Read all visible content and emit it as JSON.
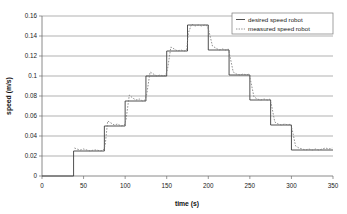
{
  "chart_data": {
    "type": "line",
    "title": "",
    "xlabel": "time (s)",
    "ylabel": "speed (m/s)",
    "xlim": [
      0,
      350
    ],
    "ylim": [
      0,
      0.16
    ],
    "grid": true,
    "legend_position": "top-right",
    "xticks": [
      "0",
      "50",
      "100",
      "150",
      "200",
      "250",
      "300",
      "350"
    ],
    "xtick_values": [
      0,
      50,
      100,
      150,
      200,
      250,
      300,
      350
    ],
    "yticks": [
      "0",
      "0.02",
      "0.04",
      "0.06",
      "0.08",
      "0.1",
      "0.12",
      "0.14",
      "0.16"
    ],
    "ytick_values": [
      0,
      0.02,
      0.04,
      0.06,
      0.08,
      0.1,
      0.12,
      0.14,
      0.16
    ],
    "series": [
      {
        "name": "desired speed robot",
        "style": "solid",
        "color": "#3c3c3c",
        "x": [
          0,
          38,
          38,
          75,
          75,
          100,
          100,
          125,
          125,
          150,
          150,
          175,
          175,
          200,
          200,
          225,
          225,
          250,
          250,
          275,
          275,
          300,
          300,
          350
        ],
        "y": [
          0,
          0,
          0.025,
          0.025,
          0.05,
          0.05,
          0.075,
          0.075,
          0.1,
          0.1,
          0.125,
          0.125,
          0.151,
          0.151,
          0.126,
          0.126,
          0.101,
          0.101,
          0.076,
          0.076,
          0.051,
          0.051,
          0.026,
          0.026
        ]
      },
      {
        "name": "measured speed robot",
        "style": "dotted",
        "color": "#777777",
        "x": [
          39,
          42,
          46,
          50,
          54,
          58,
          62,
          66,
          70,
          74,
          76,
          79,
          83,
          87,
          91,
          95,
          99,
          101,
          105,
          109,
          113,
          117,
          121,
          124,
          126,
          130,
          134,
          138,
          142,
          146,
          149,
          151,
          155,
          159,
          163,
          167,
          171,
          174,
          176,
          180,
          184,
          188,
          192,
          196,
          199,
          201,
          205,
          209,
          213,
          217,
          221,
          224,
          226,
          230,
          234,
          238,
          242,
          246,
          249,
          251,
          255,
          259,
          263,
          267,
          271,
          274,
          276,
          280,
          284,
          288,
          292,
          296,
          299,
          301,
          305,
          309,
          313,
          317,
          321,
          325,
          329,
          333,
          337,
          341,
          345,
          349
        ],
        "y": [
          0.028,
          0.027,
          0.026,
          0.027,
          0.026,
          0.025,
          0.026,
          0.026,
          0.025,
          0.026,
          0.031,
          0.055,
          0.053,
          0.051,
          0.052,
          0.05,
          0.051,
          0.056,
          0.081,
          0.078,
          0.076,
          0.077,
          0.075,
          0.076,
          0.082,
          0.104,
          0.102,
          0.1,
          0.101,
          0.1,
          0.101,
          0.107,
          0.129,
          0.127,
          0.125,
          0.126,
          0.125,
          0.126,
          0.143,
          0.152,
          0.15,
          0.151,
          0.15,
          0.151,
          0.15,
          0.144,
          0.13,
          0.128,
          0.126,
          0.127,
          0.126,
          0.127,
          0.12,
          0.104,
          0.102,
          0.101,
          0.102,
          0.101,
          0.102,
          0.095,
          0.079,
          0.077,
          0.076,
          0.077,
          0.076,
          0.077,
          0.071,
          0.054,
          0.052,
          0.051,
          0.052,
          0.051,
          0.052,
          0.046,
          0.03,
          0.028,
          0.027,
          0.026,
          0.027,
          0.026,
          0.027,
          0.026,
          0.027,
          0.028,
          0.027,
          0.028
        ]
      }
    ],
    "legend_entries": [
      "desired speed robot",
      "measured speed robot"
    ]
  }
}
